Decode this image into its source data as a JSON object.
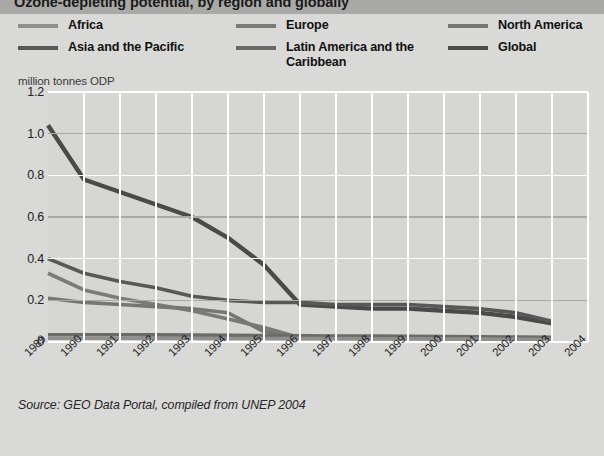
{
  "header": {
    "title": "Ozone-depleting potential, by region and globally"
  },
  "unit_label": "million tonnes ODP",
  "source_note": "Source: GEO Data Portal, compiled from UNEP 2004",
  "colors": {
    "africa": "#8f8f8d",
    "asia_pacific": "#585858",
    "europe": "#7a7a78",
    "latin_america": "#6b6b69",
    "north_america": "#767674",
    "global": "#4a4a4a",
    "grid_white": "#ffffff",
    "grid_major": "#a8a8a6",
    "plot_background": "#d6d6d4",
    "page_background": "#d9d9d7",
    "title_bar": "#a9a9a7"
  },
  "legend": {
    "columns": [
      {
        "items": [
          {
            "label": "Africa",
            "color": "#8f8f8d"
          },
          {
            "label": "Asia and the Pacific",
            "color": "#585858"
          }
        ]
      },
      {
        "items": [
          {
            "label": "Europe",
            "color": "#7a7a78"
          },
          {
            "label": "Latin America and the Caribbean",
            "color": "#6b6b69"
          }
        ]
      },
      {
        "items": [
          {
            "label": "North America",
            "color": "#767674"
          },
          {
            "label": "Global",
            "color": "#4a4a4a"
          }
        ]
      }
    ]
  },
  "chart_data": {
    "type": "line",
    "title": "Ozone-depleting potential, by region and globally",
    "xlabel": "",
    "ylabel": "million tonnes ODP",
    "x": [
      1989,
      1990,
      1991,
      1992,
      1993,
      1994,
      1995,
      1996,
      1997,
      1998,
      1999,
      2000,
      2001,
      2002,
      2003
    ],
    "xlim": [
      1989,
      2004
    ],
    "ylim": [
      0,
      1.2
    ],
    "yticks": [
      0,
      0.2,
      0.4,
      0.6,
      0.8,
      1.0,
      1.2
    ],
    "ytick_labels": [
      "0",
      "0.2",
      "0.4",
      "0.6",
      "0.8",
      "1.0",
      "1.2"
    ],
    "xtick_labels": [
      "1989",
      "1990",
      "1991",
      "1992",
      "1993",
      "1994",
      "1995",
      "1996",
      "1997",
      "1998",
      "1999",
      "2000",
      "2001",
      "2002",
      "2003",
      "2004"
    ],
    "grid": true,
    "legend_position": "top",
    "series": [
      {
        "name": "Global",
        "color": "#4a4a4a",
        "values": [
          1.04,
          0.78,
          0.72,
          0.66,
          0.6,
          0.5,
          0.37,
          0.18,
          0.17,
          0.16,
          0.16,
          0.15,
          0.14,
          0.12,
          0.09
        ]
      },
      {
        "name": "Asia and the Pacific",
        "color": "#585858",
        "values": [
          0.4,
          0.33,
          0.29,
          0.26,
          0.22,
          0.2,
          0.19,
          0.19,
          0.18,
          0.18,
          0.18,
          0.17,
          0.16,
          0.14,
          0.1
        ]
      },
      {
        "name": "Europe",
        "color": "#7a7a78",
        "values": [
          0.33,
          0.25,
          0.21,
          0.18,
          0.15,
          0.11,
          0.07,
          0.02,
          0.02,
          0.02,
          0.02,
          0.02,
          0.02,
          0.02,
          0.02
        ]
      },
      {
        "name": "North America",
        "color": "#767674",
        "values": [
          0.21,
          0.19,
          0.18,
          0.17,
          0.16,
          0.14,
          0.05,
          0.02,
          0.02,
          0.02,
          0.02,
          0.02,
          0.02,
          0.02,
          0.02
        ]
      },
      {
        "name": "Latin America and the Caribbean",
        "color": "#6b6b69",
        "values": [
          0.035,
          0.035,
          0.035,
          0.034,
          0.033,
          0.032,
          0.031,
          0.03,
          0.029,
          0.028,
          0.027,
          0.026,
          0.025,
          0.024,
          0.022
        ]
      },
      {
        "name": "Africa",
        "color": "#8f8f8d",
        "values": [
          0.018,
          0.018,
          0.018,
          0.018,
          0.018,
          0.017,
          0.017,
          0.016,
          0.016,
          0.015,
          0.015,
          0.014,
          0.014,
          0.013,
          0.012
        ]
      }
    ]
  }
}
